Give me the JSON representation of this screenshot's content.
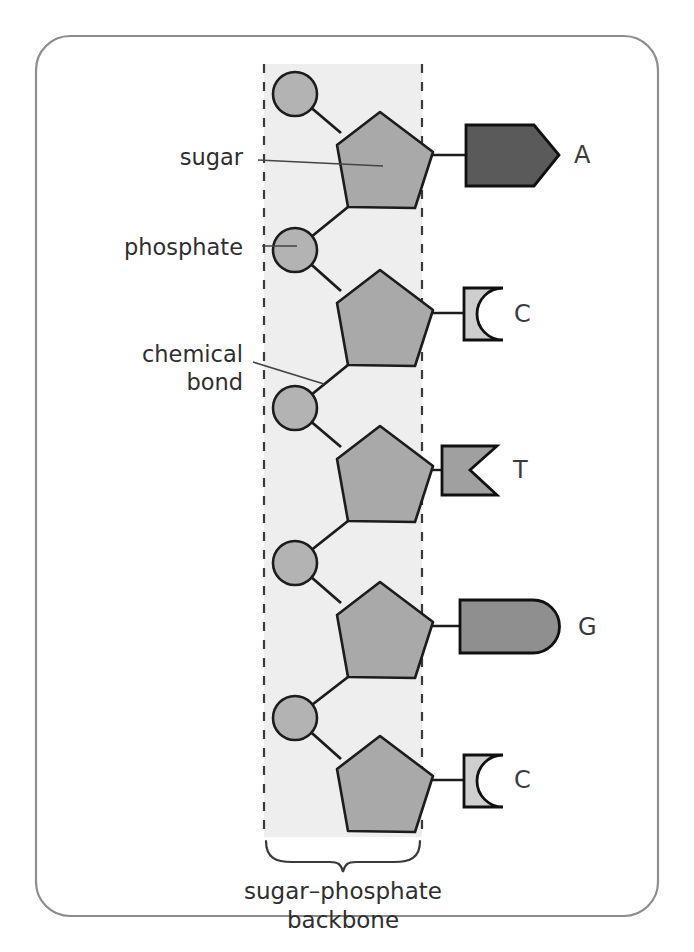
{
  "figure": {
    "background_color": "#ffffff",
    "frame_color": "#8d8d8d",
    "band_color": "#eeeeee",
    "dash_color": "#3a3a3a"
  },
  "callouts": [
    {
      "label": "sugar",
      "x": 243,
      "y": 165
    },
    {
      "label": "phosphate",
      "x": 243,
      "y": 248
    },
    {
      "label": "chemical",
      "x": 243,
      "y": 360
    },
    {
      "label": "bond",
      "x": 243,
      "y": 388
    }
  ],
  "caption": {
    "line1": "sugar–phosphate",
    "line2": "backbone"
  },
  "parts": {
    "sugar_name": "sugar",
    "phosphate_name": "phosphate",
    "bond_name": "chemical bond"
  },
  "nucleotides": [
    {
      "base": "A",
      "base_shape": "arrow-pentagon",
      "base_color": "#5a5a5a",
      "letter_x": 574,
      "letter_y": 163,
      "sugar_cy": 160,
      "phosphate_cy": 94,
      "stem_y": 155
    },
    {
      "base": "C",
      "base_shape": "concave-square",
      "base_color": "#cecece",
      "letter_x": 514,
      "letter_y": 318,
      "sugar_cy": 318,
      "phosphate_cy": 250,
      "stem_y": 313
    },
    {
      "base": "T",
      "base_shape": "notched-square",
      "base_color": "#a0a0a0",
      "letter_x": 513,
      "letter_y": 478,
      "sugar_cy": 474,
      "phosphate_cy": 408,
      "stem_y": 470
    },
    {
      "base": "G",
      "base_shape": "rounded-bar",
      "base_color": "#8f8f8f",
      "letter_x": 578,
      "letter_y": 630,
      "sugar_cy": 630,
      "phosphate_cy": 563,
      "stem_y": 626
    },
    {
      "base": "C",
      "base_shape": "concave-square",
      "base_color": "#cecece",
      "letter_x": 514,
      "letter_y": 784,
      "sugar_cy": 786,
      "phosphate_cy": 718,
      "stem_y": 780
    }
  ],
  "colors": {
    "sugar_fill": "#a9a9a9",
    "phosphate_fill": "#b3b3b3",
    "outline": "#1c1c1c",
    "base_A": "#5a5a5a",
    "base_C": "#cecece",
    "base_T": "#a0a0a0",
    "base_G": "#8f8f8f"
  }
}
